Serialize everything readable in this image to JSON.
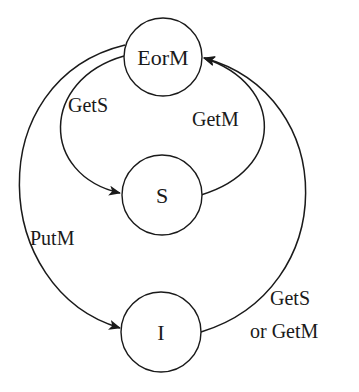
{
  "diagram": {
    "type": "state-transition",
    "colors": {
      "stroke": "#1a1a1a",
      "background": "#ffffff"
    },
    "states": [
      {
        "id": "EorM",
        "label": "EorM"
      },
      {
        "id": "S",
        "label": "S"
      },
      {
        "id": "I",
        "label": "I"
      }
    ],
    "transitions": [
      {
        "from": "EorM",
        "to": "S",
        "label": "GetS"
      },
      {
        "from": "S",
        "to": "EorM",
        "label": "GetM"
      },
      {
        "from": "EorM",
        "to": "I",
        "label": "PutM"
      },
      {
        "from": "I",
        "to": "EorM",
        "label_line1": "GetS",
        "label_line2": "or GetM"
      }
    ]
  }
}
